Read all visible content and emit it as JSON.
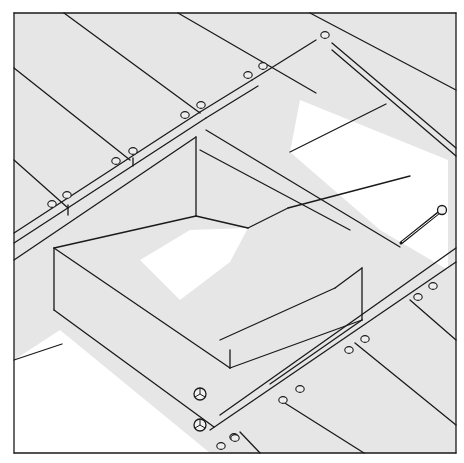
{
  "figure": {
    "title": "",
    "colors": {
      "line": "#1a1a1a",
      "board_fill": "#e6e6e6",
      "void_fill": "#ffffff"
    },
    "frame": {
      "x": 14,
      "y": 13,
      "w": 442,
      "h": 440
    },
    "labels": []
  },
  "shaded_polygons": [
    "14,13 456,13 456,453 14,453"
  ],
  "void_polygons": [
    "300,100 448,160 448,270 380,230 290,152",
    "140,260 190,230 248,228 230,262 180,300",
    "14,360 60,330 210,453 14,453"
  ],
  "lines": [
    "14,13 456,13",
    "456,13 456,453",
    "456,453 14,453",
    "14,453 14,13",
    "64,13 200,113",
    "178,13 316,93",
    "310,13 456,90",
    "14,68 130,160",
    "14,160 68,208",
    "14,233 200,112",
    "14,243 206,118",
    "14,260 196,137",
    "68,205 68,215",
    "200,112 252,80",
    "206,118 258,86",
    "252,80 316,40",
    "133,158 133,166",
    "332,43 456,148",
    "332,50 456,156",
    "196,137 196,216",
    "196,216 248,228",
    "206,130 400,247",
    "200,150 350,230",
    "248,228 288,208",
    "288,208 410,176",
    "290,152 386,104",
    "54,248 54,310",
    "54,248 196,216",
    "54,310 214,427",
    "54,248 230,368",
    "62,344 14,360",
    "220,340 335,288",
    "335,288 362,268",
    "362,268 362,320",
    "230,368 362,320",
    "230,368 230,350",
    "270,384 362,320",
    "220,415 456,248",
    "210,430 456,262",
    "410,300 456,340",
    "355,343 456,425",
    "280,400 364,453",
    "240,432 260,453"
  ],
  "screw_holes": [
    [
      52,
      204
    ],
    [
      67,
      195
    ],
    [
      116,
      161
    ],
    [
      133,
      151
    ],
    [
      185,
      115
    ],
    [
      201,
      105
    ],
    [
      248,
      75
    ],
    [
      263,
      66
    ],
    [
      325,
      35
    ],
    [
      418,
      297
    ],
    [
      433,
      286
    ],
    [
      349,
      350
    ],
    [
      365,
      339
    ],
    [
      283,
      400
    ],
    [
      300,
      389
    ],
    [
      221,
      446
    ],
    [
      234,
      437
    ],
    [
      235,
      438
    ]
  ],
  "bolt_heads": [
    [
      200,
      394
    ],
    [
      200,
      425
    ]
  ],
  "lag_bolt": {
    "head": [
      442,
      210
    ],
    "tip": [
      401,
      243
    ]
  }
}
